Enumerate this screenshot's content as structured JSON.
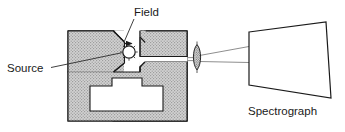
{
  "figure": {
    "type": "optical-apparatus-schematic",
    "labels": {
      "field": "Field",
      "source": "Source",
      "spectrograph": "Spectrograph"
    },
    "colors": {
      "magnet_fill": "#cfcfcf",
      "hatch_line": "#9a9a9a",
      "outline": "#1a1a1a",
      "ray_line": "#6a6a6a",
      "leader_line": "#3a3a3a",
      "background": "#ffffff",
      "text": "#1a1a1a"
    },
    "components": [
      {
        "name": "electromagnet-yoke",
        "description": "C-shaped hatched magnet body with T-shaped coil window",
        "fill": "#cfcfcf"
      },
      {
        "name": "left-pole-piece",
        "description": "chamfered pole piece on left of gap"
      },
      {
        "name": "upper-right-pole-piece",
        "description": "upper right pole piece above the exit slit"
      },
      {
        "name": "lower-right-pole-piece",
        "description": "lower right pole piece below the exit slit"
      },
      {
        "name": "light-source",
        "description": "radiating circular source in the magnet gap"
      },
      {
        "name": "field-arrow",
        "description": "arrowhead indicating magnetic field direction in the gap"
      },
      {
        "name": "condensing-lens",
        "description": "hatched biconvex lens between magnet and spectrograph"
      },
      {
        "name": "light-rays",
        "description": "rays converging through the lens into the spectrograph"
      },
      {
        "name": "spectrograph-body",
        "description": "trapezoidal outline representing the spectrograph"
      }
    ]
  }
}
